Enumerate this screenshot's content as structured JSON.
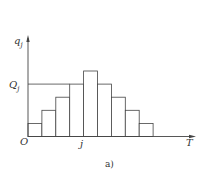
{
  "chart_data": {
    "type": "bar",
    "title": "",
    "caption": "a)",
    "xlabel": "T",
    "ylabel": "q_j",
    "origin_label": "O",
    "x_marker_label": "j",
    "y_marker_label": "Q_j",
    "categories": [
      "1",
      "2",
      "3",
      "4",
      "5",
      "6",
      "7",
      "8",
      "9"
    ],
    "values": [
      1,
      2,
      3,
      4,
      5,
      4,
      3,
      2,
      1
    ],
    "grid": false,
    "legend": null,
    "annotations": [
      {
        "type": "hline",
        "label": "Q_j",
        "y": 4,
        "from_x": 0,
        "to_x": "bar 4"
      }
    ]
  },
  "labels": {
    "ylabel_main": "q",
    "ylabel_sub": "j",
    "ymarker_main": "Q",
    "ymarker_sub": "j",
    "origin": "O",
    "xmarker": "j",
    "xlabel": "T",
    "caption": "a)"
  },
  "colors": {
    "stroke": "#444444",
    "bar_fill": "#ffffff",
    "text": "#333333"
  }
}
